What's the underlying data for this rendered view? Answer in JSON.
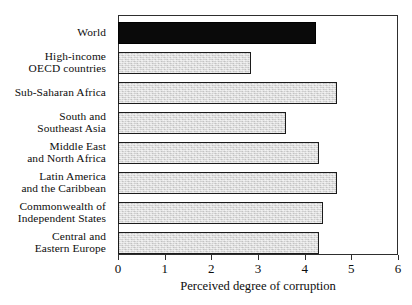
{
  "chart_data": {
    "type": "bar",
    "orientation": "horizontal",
    "title": "",
    "xlabel": "Perceived degree of corruption",
    "ylabel": "",
    "xlim": [
      0,
      6
    ],
    "xticks": [
      "0",
      "1",
      "2",
      "3",
      "4",
      "5",
      "6"
    ],
    "grid": false,
    "legend": null,
    "categories": [
      "World",
      "High-income OECD countries",
      "Sub-Saharan Africa",
      "South and Southeast Asia",
      "Middle East and North Africa",
      "Latin America and the Caribbean",
      "Commonwealth of Independent States",
      "Central and Eastern Europe"
    ],
    "values": [
      4.25,
      2.85,
      4.7,
      3.6,
      4.3,
      4.7,
      4.4,
      4.3
    ],
    "bars": [
      {
        "label_lines": [
          "World"
        ],
        "smallcaps_line_index": -1,
        "value": 4.25,
        "style": "black",
        "color": "#0a0a0a"
      },
      {
        "label_lines": [
          "High-income",
          "OECD countries"
        ],
        "smallcaps_line_index": 1,
        "smallcaps_word": "OECD",
        "smallcaps_rest": " countries",
        "value": 2.85,
        "style": "gray",
        "color": "#d2d2d2"
      },
      {
        "label_lines": [
          "Sub-Saharan Africa"
        ],
        "smallcaps_line_index": -1,
        "value": 4.7,
        "style": "gray",
        "color": "#d2d2d2"
      },
      {
        "label_lines": [
          "South and",
          "Southeast Asia"
        ],
        "smallcaps_line_index": -1,
        "value": 3.6,
        "style": "gray",
        "color": "#d2d2d2"
      },
      {
        "label_lines": [
          "Middle East",
          "and North Africa"
        ],
        "smallcaps_line_index": -1,
        "value": 4.3,
        "style": "gray",
        "color": "#d2d2d2"
      },
      {
        "label_lines": [
          "Latin America",
          "and the Caribbean"
        ],
        "smallcaps_line_index": -1,
        "value": 4.7,
        "style": "gray",
        "color": "#d2d2d2"
      },
      {
        "label_lines": [
          "Commonwealth of",
          "Independent States"
        ],
        "smallcaps_line_index": -1,
        "value": 4.4,
        "style": "gray",
        "color": "#d2d2d2"
      },
      {
        "label_lines": [
          "Central and",
          "Eastern Europe"
        ],
        "smallcaps_line_index": -1,
        "value": 4.3,
        "style": "gray",
        "color": "#d2d2d2"
      }
    ],
    "colors": {
      "highlight_bar": "#0a0a0a",
      "bar_fill": "#d2d2d2",
      "bar_border": "#1b1b1b",
      "frame": "#2e2e2e",
      "background": "#ffffff",
      "text": "#0d0d0d"
    }
  }
}
